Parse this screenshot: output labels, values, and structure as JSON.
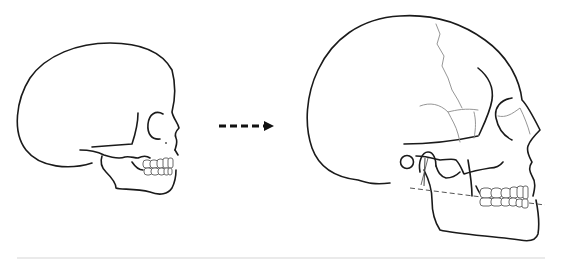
{
  "figure": {
    "panels": [
      {
        "id": "infant-skull",
        "label": ""
      },
      {
        "id": "adult-skull",
        "label": ""
      }
    ],
    "arrow": {
      "style": "dashed",
      "direction": "right"
    },
    "colors": {
      "outline": "#1a1a1a",
      "sutures": "#8a8a8a",
      "teeth": "#6a6a6a",
      "divider": "#e3e3e3",
      "background": "#ffffff"
    }
  }
}
